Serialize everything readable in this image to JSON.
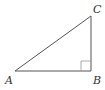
{
  "diagram": {
    "type": "right-triangle",
    "vertices": [
      {
        "id": "A",
        "label": "A",
        "x": 15,
        "y": 71
      },
      {
        "id": "B",
        "label": "B",
        "x": 91,
        "y": 71
      },
      {
        "id": "C",
        "label": "C",
        "x": 91,
        "y": 16
      }
    ],
    "right_angle_at": "B",
    "colors": {
      "stroke": "#555555",
      "marker": "#999999",
      "label": "#333333"
    }
  },
  "labels": {
    "a": "A",
    "b": "B",
    "c": "C"
  }
}
